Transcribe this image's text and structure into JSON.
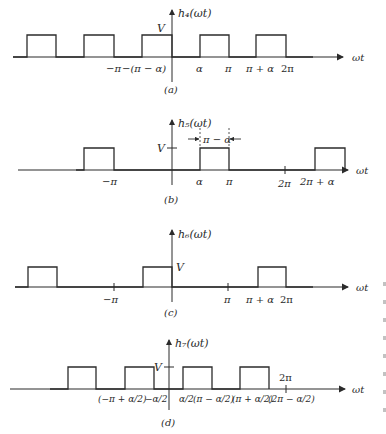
{
  "figure": {
    "colors": {
      "line": "#2b2b2b",
      "text": "#2a2a2a"
    },
    "panels": [
      {
        "id": "a",
        "caption": "(a)",
        "ylabel": "h₄(ωt)",
        "xlabel": "ωt",
        "level_label": "V",
        "ticks": [
          "−π",
          "−(π − α)",
          "α",
          "π",
          "π + α",
          "2π"
        ],
        "pulses": [
          [
            27,
            56
          ],
          [
            84,
            114
          ],
          [
            142,
            172
          ],
          [
            200,
            229
          ],
          [
            256,
            286
          ]
        ]
      },
      {
        "id": "b",
        "caption": "(b)",
        "ylabel": "h₅(ωt)",
        "xlabel": "ωt",
        "level_label": "V",
        "width_annotation": "π − α",
        "ticks": [
          "−π",
          "α",
          "π",
          "2π",
          "2π + α"
        ],
        "pulses": [
          [
            84,
            114
          ],
          [
            200,
            229
          ],
          [
            315,
            345
          ]
        ]
      },
      {
        "id": "c",
        "caption": "(c)",
        "ylabel": "h₆(ωt)",
        "xlabel": "ωt",
        "level_label": "V",
        "ticks": [
          "−π",
          "π",
          "π + α",
          "2π"
        ],
        "pulses": [
          [
            28,
            57
          ],
          [
            143,
            172
          ],
          [
            258,
            286
          ]
        ]
      },
      {
        "id": "d",
        "caption": "(d)",
        "ylabel": "h₇(ωt)",
        "xlabel": "ωt",
        "level_label": "V",
        "ticks": [
          "(−π + α/2)",
          "−α/2",
          "α/2",
          "(π − α/2)",
          "(π + α/2)",
          "(2π − α/2)",
          "2π"
        ],
        "pulses": [
          [
            68,
            96
          ],
          [
            125,
            154
          ],
          [
            183,
            212
          ],
          [
            240,
            269
          ]
        ]
      }
    ]
  }
}
